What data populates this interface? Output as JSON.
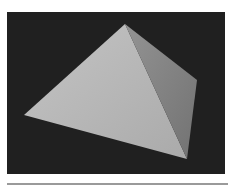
{
  "image": {
    "subject": "pyramid",
    "description": "Grayscale render of a square pyramid on a dark background",
    "colors": {
      "page_background": "#ffffff",
      "backdrop": "#202020",
      "front_face": "#b5b5b5",
      "front_face_highlight": "#c2c2c2",
      "side_face": "#8a8a8a",
      "side_face_shadow": "#767676",
      "bottom_rule": "#9a9a9a"
    },
    "backdrop_rect": {
      "x": 7,
      "y": 12,
      "width": 218,
      "height": 162
    },
    "vertices": {
      "apex": [
        125,
        24
      ],
      "left": [
        24,
        115
      ],
      "bottom": [
        187,
        159
      ],
      "right": [
        197,
        80
      ]
    },
    "bottom_rule": {
      "x1": 7,
      "x2": 228,
      "y": 184
    }
  }
}
